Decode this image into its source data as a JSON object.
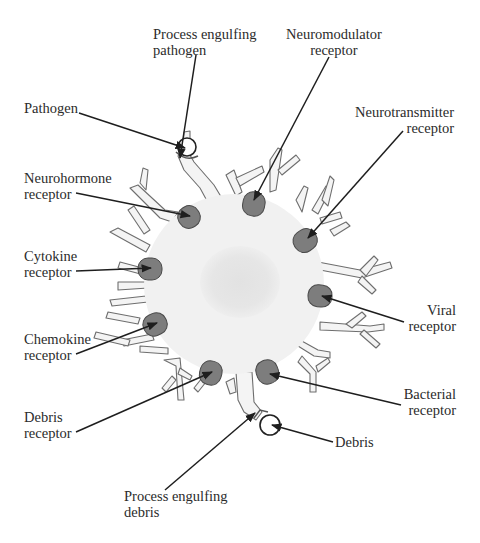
{
  "diagram": {
    "colors": {
      "background": "#ffffff",
      "cell_body": "#f1f1f1",
      "nucleus": "#e4e4e4",
      "process_outline": "#6e6e6e",
      "receptor_fill": "#7d7d7d",
      "receptor_stroke": "#4a4a4a",
      "leader_line": "#1e1e1e",
      "text": "#2b2b2b"
    },
    "labels": {
      "process_engulfing_pathogen": {
        "line1": "Process engulfing",
        "line2": "pathogen"
      },
      "neuromodulator_receptor": {
        "line1": "Neuromodulator",
        "line2": "receptor"
      },
      "pathogen": {
        "line1": "Pathogen"
      },
      "neurotransmitter_receptor": {
        "line1": "Neurotransmitter",
        "line2": "receptor"
      },
      "neurohormone_receptor": {
        "line1": "Neurohormone",
        "line2": "receptor"
      },
      "cytokine_receptor": {
        "line1": "Cytokine",
        "line2": "receptor"
      },
      "viral_receptor": {
        "line1": "Viral",
        "line2": "receptor"
      },
      "chemokine_receptor": {
        "line1": "Chemokine",
        "line2": "receptor"
      },
      "bacterial_receptor": {
        "line1": "Bacterial",
        "line2": "receptor"
      },
      "debris_receptor": {
        "line1": "Debris",
        "line2": "receptor"
      },
      "debris": {
        "line1": "Debris"
      },
      "process_engulfing_debris": {
        "line1": "Process engulfing",
        "line2": "debris"
      }
    },
    "receptors": [
      {
        "name": "Neurohormone receptor",
        "cx": 189,
        "cy": 217,
        "angle": -30
      },
      {
        "name": "Neuromodulator receptor",
        "cx": 254,
        "cy": 203,
        "angle": 10
      },
      {
        "name": "Neurotransmitter receptor",
        "cx": 306,
        "cy": 240,
        "angle": 55
      },
      {
        "name": "Cytokine receptor",
        "cx": 151,
        "cy": 269,
        "angle": 90
      },
      {
        "name": "Viral receptor",
        "cx": 321,
        "cy": 296,
        "angle": 95
      },
      {
        "name": "Chemokine receptor",
        "cx": 156,
        "cy": 324,
        "angle": 65
      },
      {
        "name": "Debris receptor",
        "cx": 211,
        "cy": 372,
        "angle": 15
      },
      {
        "name": "Bacterial receptor",
        "cx": 267,
        "cy": 371,
        "angle": -20
      }
    ]
  }
}
